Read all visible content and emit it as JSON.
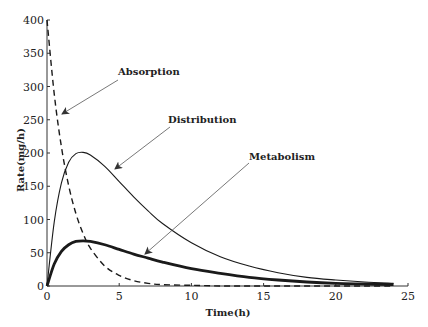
{
  "chart_data": {
    "type": "line",
    "title": "",
    "xlabel": "Time(h)",
    "ylabel": "Rate(mg/h)",
    "xlim": [
      0,
      25
    ],
    "ylim": [
      0,
      400
    ],
    "xticks": [
      0,
      5,
      10,
      15,
      20,
      25
    ],
    "yticks": [
      0,
      50,
      100,
      150,
      200,
      250,
      300,
      350,
      400
    ],
    "grid": false,
    "legend": "none (annotated with arrows)",
    "x": [
      0,
      0.5,
      1,
      1.5,
      2,
      2.5,
      3,
      4,
      5,
      6,
      7,
      8,
      10,
      12,
      14,
      16,
      18,
      20,
      22,
      24
    ],
    "series": [
      {
        "name": "Absorption",
        "style": "dashed",
        "values": [
          400,
          289,
          209,
          151,
          109,
          79,
          57,
          30,
          16,
          8,
          4,
          2,
          1,
          0,
          0,
          0,
          0,
          0,
          0,
          0
        ]
      },
      {
        "name": "Distribution",
        "style": "solid thin",
        "values": [
          0,
          96,
          155,
          186,
          199,
          201,
          197,
          180,
          157,
          134,
          113,
          94,
          65,
          44,
          30,
          20,
          13,
          9,
          6,
          4
        ]
      },
      {
        "name": "Metabolism",
        "style": "solid thick",
        "values": [
          0,
          33,
          52,
          62,
          67,
          68,
          67,
          62,
          55,
          48,
          42,
          36,
          26,
          19,
          13,
          9,
          6,
          4,
          3,
          2
        ]
      }
    ],
    "annotations": [
      {
        "text": "Absorption",
        "points_to": {
          "x": 0.8,
          "y": 260
        }
      },
      {
        "text": "Distribution",
        "points_to": {
          "x": 4.8,
          "y": 145
        }
      },
      {
        "text": "Metabolism",
        "points_to": {
          "x": 6.9,
          "y": 45
        }
      }
    ]
  },
  "labels": {
    "xlabel": "Time(h)",
    "ylabel": "Rate(mg/h)",
    "x_ticks": [
      "0",
      "5",
      "10",
      "15",
      "20",
      "25"
    ],
    "y_ticks": [
      "0",
      "50",
      "100",
      "150",
      "200",
      "250",
      "300",
      "350",
      "400"
    ],
    "annot_absorption": "Absorption",
    "annot_distribution": "Distribution",
    "annot_metabolism": "Metabolism"
  }
}
